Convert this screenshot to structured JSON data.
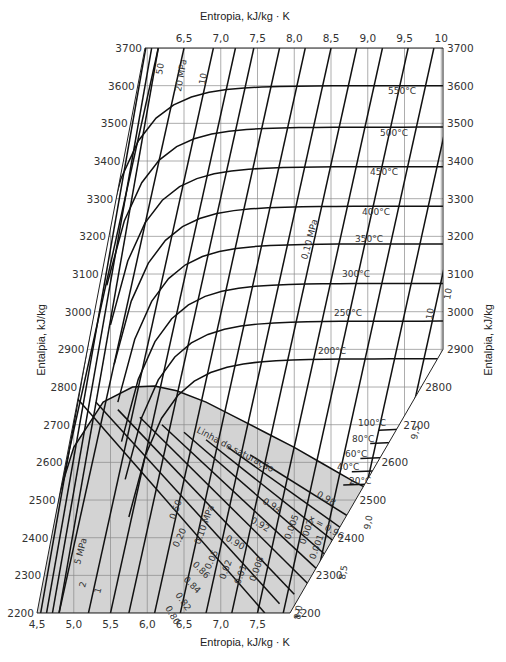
{
  "chart_data": {
    "type": "line",
    "xlabel": "Entropia, kJ/kg · K",
    "ylabel": "Entalpia, kJ/kg",
    "xlim": [
      4.5,
      10
    ],
    "ylim": [
      2200,
      3700
    ],
    "grid": true,
    "x_ticks_top": [
      "6,5",
      "7,0",
      "7,5",
      "8,0",
      "8,5",
      "9,0",
      "9,5",
      "10"
    ],
    "x_ticks_bottom": [
      "4,5",
      "5,0",
      "5,5",
      "6,0",
      "6,5",
      "7,0",
      "7,5"
    ],
    "y_ticks_left": [
      "3700",
      "3600",
      "3500",
      "3400",
      "3300",
      "3200",
      "3100",
      "3000",
      "2900",
      "2800",
      "2700",
      "2600",
      "2500",
      "2400",
      "2300",
      "2200"
    ],
    "y_ticks_right": [
      "3700",
      "3600",
      "3500",
      "3400",
      "3300",
      "3200",
      "3100",
      "3000",
      "2900",
      "2800",
      "2700",
      "2600",
      "2500",
      "2400",
      "2300",
      "2200"
    ],
    "right_edge_entropy_labels": [
      "10",
      "9,5",
      "9,0",
      "8,5",
      "8,0"
    ],
    "saturation_line_label": "Linha de saturação",
    "isobar_labels": [
      "50",
      "20 MPa",
      "10",
      "0,10 MPa",
      "10",
      "5 MPa",
      "2",
      "1",
      "0.50",
      "0.20",
      "0.10 MPa",
      "0.05",
      "0.02",
      "0.01",
      "0.008",
      "0.005",
      "0.002",
      "0.001"
    ],
    "isotherm_labels": [
      "550°C",
      "500°C",
      "450°C",
      "400°C",
      "350°C",
      "300°C",
      "250°C",
      "200°C",
      "100°C",
      "80°C",
      "60°C",
      "40°C",
      "20°C"
    ],
    "quality_labels": [
      "0.98",
      "x = 0.96",
      "0.94",
      "0.92",
      "0.90",
      "0.86",
      "0.84",
      "0.82",
      "0.80"
    ],
    "saturation_dome": {
      "s": [
        4.6,
        5.0,
        5.4,
        5.8,
        6.1,
        6.4,
        6.8,
        7.2,
        7.6,
        8.0,
        8.4,
        8.8,
        9.2
      ],
      "h": [
        2390,
        2640,
        2760,
        2800,
        2803,
        2790,
        2760,
        2720,
        2680,
        2640,
        2595,
        2550,
        2510
      ]
    },
    "isotherms": [
      {
        "t": "550°C",
        "h_plateau": 3600
      },
      {
        "t": "500°C",
        "h_plateau": 3490
      },
      {
        "t": "450°C",
        "h_plateau": 3385
      },
      {
        "t": "400°C",
        "h_plateau": 3280
      },
      {
        "t": "350°C",
        "h_plateau": 3180
      },
      {
        "t": "300°C",
        "h_plateau": 3075
      },
      {
        "t": "250°C",
        "h_plateau": 2975
      },
      {
        "t": "200°C",
        "h_plateau": 2875
      },
      {
        "t": "100°C",
        "h_plateau": 2685
      },
      {
        "t": "80°C",
        "h_plateau": 2650
      },
      {
        "t": "60°C",
        "h_plateau": 2610
      },
      {
        "t": "40°C",
        "h_plateau": 2575
      },
      {
        "t": "20°C",
        "h_plateau": 2540
      }
    ]
  },
  "labels": {
    "top_axis_title": "Entropia, kJ/kg · K",
    "bottom_axis_title": "Entropia, kJ/kg · K",
    "left_axis_title": "Entalpia, kJ/kg",
    "right_axis_title": "Entalpia, kJ/kg"
  }
}
